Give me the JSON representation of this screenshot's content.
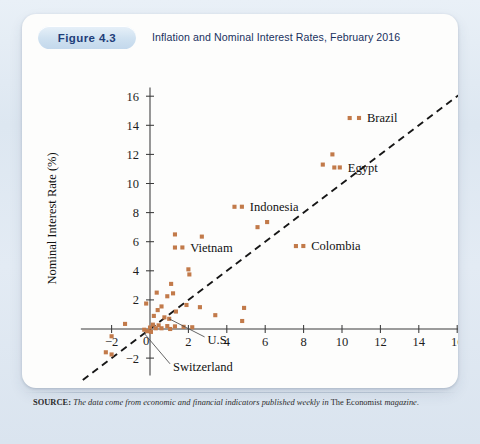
{
  "figure": {
    "badge": "Figure 4.3",
    "title": "Inflation and Nominal Interest Rates, February 2016"
  },
  "source": {
    "label": "SOURCE:",
    "italic_part_1": "The data come from economic and financial indicators published weekly in",
    "roman_part": "The Economist",
    "italic_part_2": "magazine."
  },
  "chart_data": {
    "type": "scatter",
    "title": "Inflation and Nominal Interest Rates, February 2016",
    "xlabel": "Inflation Rate (%)",
    "ylabel": "Nominal Interest Rate (%)",
    "xlim": [
      -3.6,
      16.8
    ],
    "ylim": [
      -3.6,
      16.6
    ],
    "xticks": [
      -2,
      0,
      2,
      4,
      6,
      8,
      10,
      12,
      14,
      16
    ],
    "yticks": [
      -2,
      2,
      4,
      6,
      8,
      10,
      12,
      14,
      16
    ],
    "xtick_labels": [
      "-2",
      "0",
      "2",
      "4",
      "6",
      "8",
      "10",
      "12",
      "14",
      "16"
    ],
    "ytick_labels": [
      "-2",
      "2",
      "4",
      "6",
      "8",
      "10",
      "12",
      "14",
      "16"
    ],
    "grid": false,
    "legend": "none",
    "marker_color": "#c27a4a",
    "marker_shape": "square",
    "reference_line": {
      "label": "45-degree line",
      "style": "dashed",
      "from": [
        -3.5,
        -3.5
      ],
      "to": [
        16.2,
        16.2
      ]
    },
    "annotations": [
      {
        "text": "Brazil",
        "point": [
          10.4,
          14.5
        ],
        "label_x": 11.3,
        "label_y": 14.5,
        "leader": false
      },
      {
        "text": "Egypt",
        "point": [
          9.6,
          11.1
        ],
        "label_x": 10.3,
        "label_y": 11.1,
        "leader": false
      },
      {
        "text": "Indonesia",
        "point": [
          4.4,
          8.4
        ],
        "label_x": 5.2,
        "label_y": 8.4,
        "leader": false
      },
      {
        "text": "Colombia",
        "point": [
          7.6,
          5.7
        ],
        "label_x": 8.4,
        "label_y": 5.7,
        "leader": false
      },
      {
        "text": "Vietnam",
        "point": [
          1.3,
          5.6
        ],
        "label_x": 2.1,
        "label_y": 5.6,
        "leader": false
      },
      {
        "text": "U.S.",
        "point": [
          1.0,
          0.7
        ],
        "label_x": 3.0,
        "label_y": -0.75,
        "leader": true
      },
      {
        "text": "Switzerland",
        "point": [
          -0.3,
          -0.3
        ],
        "label_x": 1.2,
        "label_y": -2.6,
        "leader": true
      }
    ],
    "points": [
      [
        10.4,
        14.5
      ],
      [
        9.5,
        12.0
      ],
      [
        9.0,
        11.3
      ],
      [
        9.6,
        11.1
      ],
      [
        4.4,
        8.4
      ],
      [
        5.6,
        7.0
      ],
      [
        6.1,
        7.35
      ],
      [
        1.3,
        6.5
      ],
      [
        2.7,
        6.35
      ],
      [
        7.6,
        5.7
      ],
      [
        1.3,
        5.6
      ],
      [
        2.0,
        4.1
      ],
      [
        2.05,
        3.75
      ],
      [
        1.1,
        3.1
      ],
      [
        0.35,
        2.5
      ],
      [
        1.2,
        2.45
      ],
      [
        0.9,
        2.25
      ],
      [
        -0.2,
        1.75
      ],
      [
        1.9,
        1.65
      ],
      [
        0.6,
        1.55
      ],
      [
        2.6,
        1.5
      ],
      [
        4.9,
        1.45
      ],
      [
        0.4,
        1.3
      ],
      [
        1.35,
        1.2
      ],
      [
        3.4,
        0.95
      ],
      [
        0.2,
        0.9
      ],
      [
        0.75,
        0.8
      ],
      [
        1.0,
        0.7
      ],
      [
        4.8,
        0.55
      ],
      [
        -1.3,
        0.35
      ],
      [
        0.15,
        0.3
      ],
      [
        0.45,
        0.25
      ],
      [
        0.9,
        0.2
      ],
      [
        1.3,
        0.18
      ],
      [
        1.75,
        0.15
      ],
      [
        2.2,
        0.12
      ],
      [
        0.0,
        0.1
      ],
      [
        0.3,
        0.05
      ],
      [
        0.6,
        0.05
      ],
      [
        1.05,
        0.0
      ],
      [
        -0.3,
        -0.05
      ],
      [
        -0.15,
        -0.15
      ],
      [
        0.05,
        -0.2
      ],
      [
        -2.0,
        -0.5
      ],
      [
        -2.3,
        -1.6
      ],
      [
        -2.0,
        -1.75
      ]
    ]
  }
}
